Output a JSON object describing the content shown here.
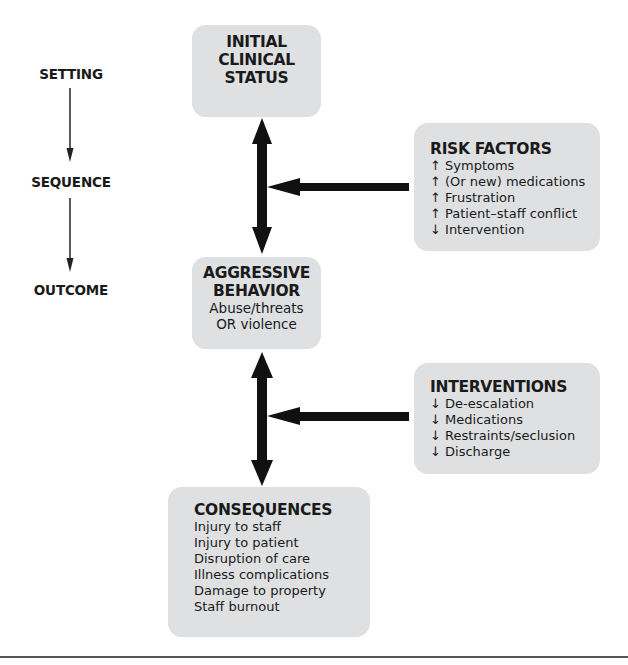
{
  "stages": [
    "SETTING",
    "SEQUENCE",
    "OUTCOME"
  ],
  "initial": {
    "title_lines": [
      "INITIAL",
      "CLINICAL",
      "STATUS"
    ]
  },
  "aggressive": {
    "title_lines": [
      "AGGRESSIVE",
      "BEHAVIOR"
    ],
    "items": [
      "Abuse/threats",
      "OR violence"
    ]
  },
  "risk_factors": {
    "title": "RISK FACTORS",
    "items": [
      {
        "dir": "↑",
        "text": "Symptoms"
      },
      {
        "dir": "↑",
        "text": "(Or new) medications"
      },
      {
        "dir": "↑",
        "text": "Frustration"
      },
      {
        "dir": "↑",
        "text": "Patient–staff conflict"
      },
      {
        "dir": "↓",
        "text": "Intervention"
      }
    ]
  },
  "interventions": {
    "title": "INTERVENTIONS",
    "items": [
      {
        "dir": "↓",
        "text": "De-escalation"
      },
      {
        "dir": "↓",
        "text": "Medications"
      },
      {
        "dir": "↓",
        "text": "Restraints/seclusion"
      },
      {
        "dir": "↓",
        "text": "Discharge"
      }
    ]
  },
  "consequences": {
    "title": "CONSEQUENCES",
    "items": [
      "Injury to staff",
      "Injury to patient",
      "Disruption of care",
      "Illness complications",
      "Damage to property",
      "Staff burnout"
    ]
  },
  "colors": {
    "box": "#dfe0e2",
    "ink": "#1a1a1a"
  }
}
